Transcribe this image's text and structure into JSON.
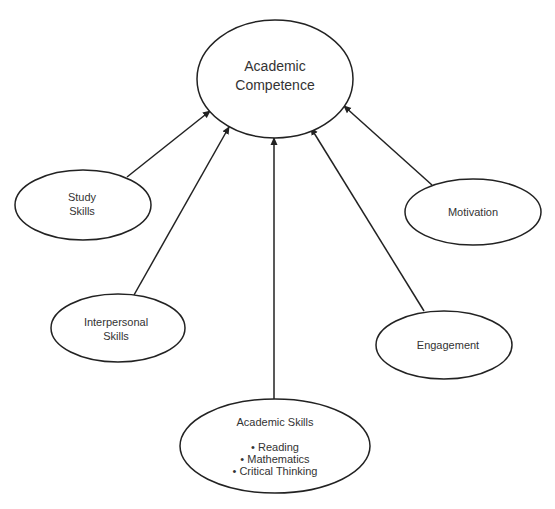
{
  "diagram": {
    "type": "concept-map",
    "colors": {
      "stroke": "#222222",
      "text": "#333333",
      "background": "#ffffff"
    },
    "central_node": {
      "id": "academic-competence",
      "lines": [
        "Academic",
        "Competence"
      ]
    },
    "nodes": [
      {
        "id": "study-skills",
        "lines": [
          "Study",
          "Skills"
        ]
      },
      {
        "id": "interpersonal-skills",
        "lines": [
          "Interpersonal",
          "Skills"
        ]
      },
      {
        "id": "academic-skills",
        "title": "Academic Skills",
        "bullets": [
          "• Reading",
          "• Mathematics",
          "• Critical Thinking"
        ]
      },
      {
        "id": "engagement",
        "lines": [
          "Engagement"
        ]
      },
      {
        "id": "motivation",
        "lines": [
          "Motivation"
        ]
      }
    ],
    "edges": [
      {
        "from": "study-skills",
        "to": "academic-competence"
      },
      {
        "from": "interpersonal-skills",
        "to": "academic-competence"
      },
      {
        "from": "academic-skills",
        "to": "academic-competence"
      },
      {
        "from": "engagement",
        "to": "academic-competence"
      },
      {
        "from": "motivation",
        "to": "academic-competence"
      }
    ]
  }
}
